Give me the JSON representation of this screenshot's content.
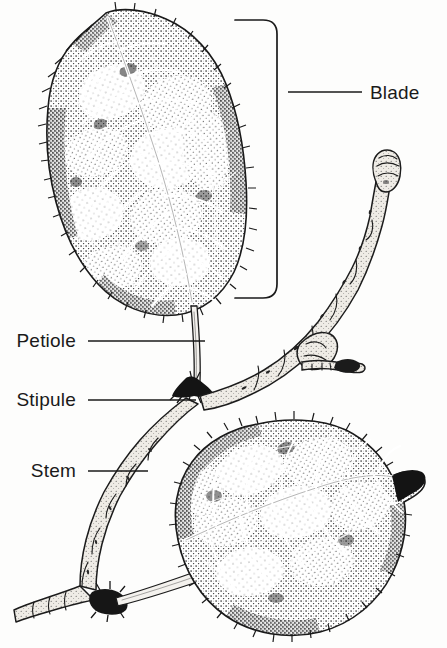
{
  "figure": {
    "style": "stippled pen-and-ink botanical illustration",
    "background_color": "#fdfdfc",
    "ink_color": "#151515",
    "width": 447,
    "height": 648
  },
  "labels": [
    {
      "id": "blade",
      "text": "Blade",
      "anchor": "start",
      "text_x": 370,
      "text_y": 99,
      "leader": {
        "x1": 288,
        "y1": 92,
        "x2": 362,
        "y2": 92
      },
      "marker": "bracket",
      "points_to": "upper leaf lamina"
    },
    {
      "id": "petiole",
      "text": "Petiole",
      "anchor": "end",
      "text_x": 76,
      "text_y": 347,
      "leader": {
        "x1": 88,
        "y1": 341,
        "x2": 205,
        "y2": 341
      },
      "marker": "line",
      "points_to": "leaf stalk"
    },
    {
      "id": "stipule",
      "text": "Stipule",
      "anchor": "end",
      "text_x": 76,
      "text_y": 406,
      "leader": {
        "x1": 88,
        "y1": 400,
        "x2": 196,
        "y2": 400
      },
      "marker": "line",
      "points_to": "paired appendage at petiole base"
    },
    {
      "id": "stem",
      "text": "Stem",
      "anchor": "end",
      "text_x": 76,
      "text_y": 477,
      "leader": {
        "x1": 88,
        "y1": 471,
        "x2": 148,
        "y2": 471
      },
      "marker": "line",
      "points_to": "woody twig"
    }
  ],
  "bracket": {
    "id": "blade-bracket",
    "top_y": 20,
    "bottom_y": 298,
    "spine_x": 277,
    "arm_x": 235,
    "corner_radius": 14
  },
  "parts": [
    {
      "id": "upper-leaf-blade",
      "name": "Blade (upper leaf)",
      "bbox": [
        48,
        10,
        197,
        312
      ]
    },
    {
      "id": "upper-leaf-petiole",
      "name": "Petiole",
      "bbox": [
        188,
        312,
        22,
        78
      ]
    },
    {
      "id": "upper-stipule",
      "name": "Stipule",
      "bbox": [
        172,
        378,
        38,
        22
      ]
    },
    {
      "id": "twig-stem",
      "name": "Stem",
      "bbox": [
        55,
        380,
        345,
        235
      ]
    },
    {
      "id": "terminal-bud",
      "name": "Terminal bud",
      "bbox": [
        362,
        152,
        38,
        40
      ]
    },
    {
      "id": "lateral-bud",
      "name": "Lateral bud",
      "bbox": [
        300,
        355,
        60,
        30
      ]
    },
    {
      "id": "lower-leaf-blade",
      "name": "Blade (lower leaf)",
      "bbox": [
        175,
        420,
        250,
        220
      ]
    },
    {
      "id": "lower-stipule",
      "name": "Stipule (lower node)",
      "bbox": [
        88,
        592,
        40,
        24
      ]
    }
  ]
}
